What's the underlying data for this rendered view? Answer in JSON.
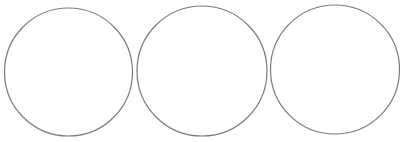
{
  "canvas": {
    "width": 403,
    "height": 142,
    "background": "#ffffff"
  },
  "style": {
    "stroke": "#7a7a7a",
    "stroke_width": 1.2,
    "fill": "#ffffff"
  },
  "circles": [
    {
      "cx": 68.5,
      "cy": 72,
      "r": 64
    },
    {
      "cx": 202,
      "cy": 71,
      "r": 65
    },
    {
      "cx": 335,
      "cy": 69.5,
      "r": 64.5
    }
  ]
}
